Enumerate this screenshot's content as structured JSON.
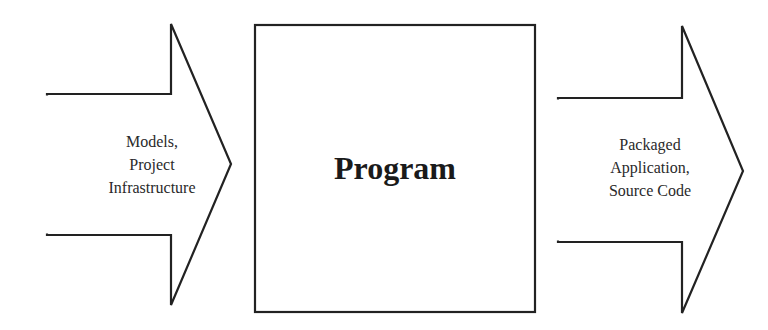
{
  "diagram": {
    "type": "flow",
    "input_arrow": {
      "lines": [
        "Models,",
        "Project",
        "Infrastructure"
      ]
    },
    "process_box": {
      "label": "Program"
    },
    "output_arrow": {
      "lines": [
        "Packaged",
        "Application,",
        "Source Code"
      ]
    },
    "colors": {
      "stroke": "#222222",
      "background": "#ffffff",
      "text": "#2a2a2a"
    }
  }
}
